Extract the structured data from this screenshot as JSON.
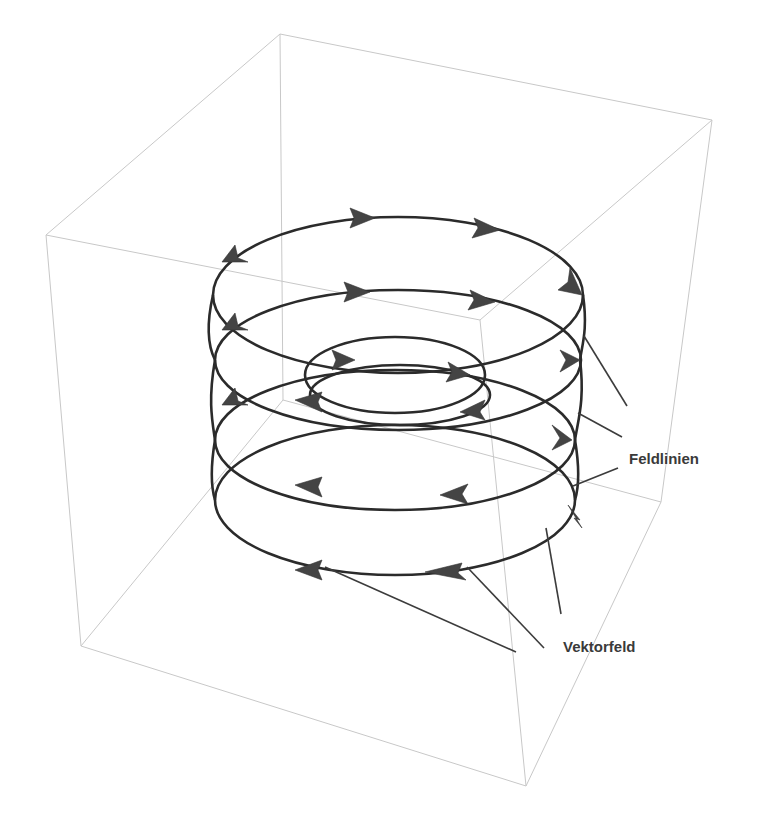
{
  "diagram": {
    "type": "3d-field-lines",
    "labels": {
      "field_lines": "Feldlinien",
      "vector_field": "Vektorfeld"
    },
    "colors": {
      "box_edge": "#c8c8c8",
      "curve": "#2b2b2b",
      "arrowhead": "#444444",
      "label_text": "#3a3a3a",
      "background": "#ffffff"
    },
    "box_corners": {
      "top_back": [
        280,
        34
      ],
      "top_left": [
        46,
        235
      ],
      "top_right": [
        712,
        120
      ],
      "top_front": [
        480,
        320
      ],
      "bottom_back": [
        283,
        400
      ],
      "bottom_left": [
        81,
        646
      ],
      "bottom_right": [
        661,
        502
      ],
      "bottom_front": [
        526,
        786
      ]
    }
  }
}
